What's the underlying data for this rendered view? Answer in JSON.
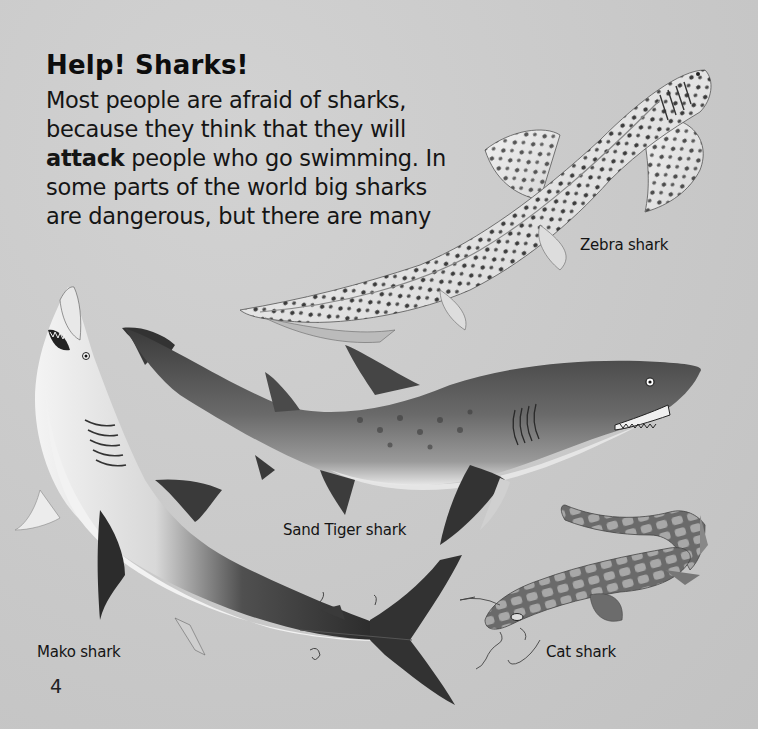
{
  "page": {
    "title": "Help! Sharks!",
    "paragraph": {
      "lines": [
        {
          "pre": "Most people are afraid of sharks,",
          "bold": "",
          "post": ""
        },
        {
          "pre": "because they think that they will",
          "bold": "",
          "post": ""
        },
        {
          "pre": "",
          "bold": "attack",
          "post": " people who go swimming. In"
        },
        {
          "pre": "some parts of the world big sharks",
          "bold": "",
          "post": ""
        },
        {
          "pre": "are dangerous, but there are many",
          "bold": "",
          "post": ""
        }
      ]
    },
    "page_number": "4"
  },
  "illustrations": [
    {
      "name": "zebra-shark",
      "label": "Zebra shark"
    },
    {
      "name": "sand-tiger-shark",
      "label": "Sand Tiger shark"
    },
    {
      "name": "mako-shark",
      "label": "Mako shark"
    },
    {
      "name": "cat-shark",
      "label": "Cat shark"
    }
  ],
  "colors": {
    "background": "#c9c9c9",
    "text": "#111111"
  }
}
